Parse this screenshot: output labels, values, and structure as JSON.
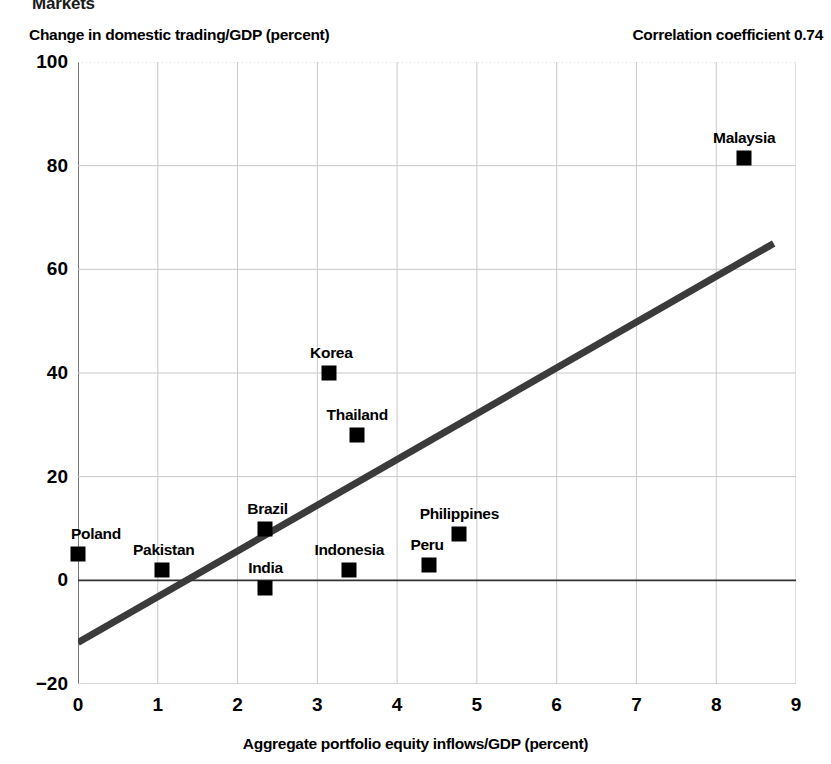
{
  "figure": {
    "title": "Markets",
    "y_axis_caption": "Change in domestic trading/GDP (percent)",
    "correlation_note": "Correlation coefficient 0.74",
    "x_axis_label": "Aggregate portfolio equity inflows/GDP (percent)"
  },
  "chart_data": {
    "type": "scatter",
    "title": "Markets",
    "xlabel": "Aggregate portfolio equity inflows/GDP (percent)",
    "ylabel": "Change in domestic trading/GDP (percent)",
    "annotation": "Correlation coefficient 0.74",
    "correlation_coefficient": 0.74,
    "xlim": [
      0,
      9
    ],
    "ylim": [
      -20,
      100
    ],
    "xticks": [
      0,
      1,
      2,
      3,
      4,
      5,
      6,
      7,
      8,
      9
    ],
    "yticks": [
      -20,
      0,
      20,
      40,
      60,
      80,
      100
    ],
    "grid": true,
    "legend": "none",
    "marker": "square",
    "marker_color": "#000000",
    "points": [
      {
        "label": "Poland",
        "x": 0.0,
        "y": 5,
        "label_dx": 18,
        "label_dy": -11
      },
      {
        "label": "Pakistan",
        "x": 1.05,
        "y": 2,
        "label_dx": 2,
        "label_dy": -11
      },
      {
        "label": "Brazil",
        "x": 2.35,
        "y": 10,
        "label_dx": 2,
        "label_dy": -11
      },
      {
        "label": "India",
        "x": 2.35,
        "y": -1.5,
        "label_dx": 0,
        "label_dy": -11
      },
      {
        "label": "Korea",
        "x": 3.15,
        "y": 40,
        "label_dx": 2,
        "label_dy": -11
      },
      {
        "label": "Indonesia",
        "x": 3.4,
        "y": 2,
        "label_dx": 0,
        "label_dy": -11
      },
      {
        "label": "Thailand",
        "x": 3.5,
        "y": 28,
        "label_dx": 0,
        "label_dy": -11
      },
      {
        "label": "Peru",
        "x": 4.4,
        "y": 3,
        "label_dx": -2,
        "label_dy": -11
      },
      {
        "label": "Philippines",
        "x": 4.78,
        "y": 9,
        "label_dx": 0,
        "label_dy": -11
      },
      {
        "label": "Malaysia",
        "x": 8.35,
        "y": 81.5,
        "label_dx": 0,
        "label_dy": -11
      }
    ],
    "trendline": {
      "x_start": 0.0,
      "y_start": -12,
      "x_end": 8.72,
      "y_end": 65,
      "color": "#3b3b3b",
      "width": 7
    }
  },
  "colors": {
    "grid": "#c8c8c8",
    "axis": "#555555",
    "marker": "#000000",
    "trend": "#3b3b3b",
    "text": "#000000"
  }
}
